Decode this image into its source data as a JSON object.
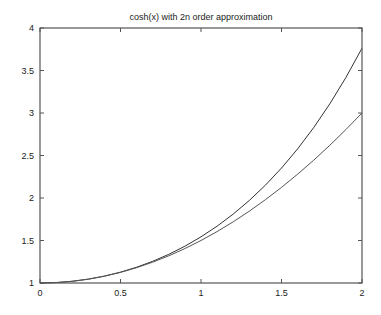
{
  "chart_data": {
    "type": "line",
    "title": "cosh(x) with 2n order approximation",
    "xlabel": "",
    "ylabel": "",
    "xlim": [
      0,
      2
    ],
    "ylim": [
      1,
      4
    ],
    "grid": false,
    "legend": null,
    "x_ticks": [
      0,
      0.5,
      1,
      1.5,
      2
    ],
    "x_tick_labels": [
      "0",
      "0.5",
      "1",
      "1.5",
      "2"
    ],
    "y_ticks": [
      1,
      1.5,
      2,
      2.5,
      3,
      3.5,
      4
    ],
    "y_tick_labels": [
      "1",
      "1.5",
      "2",
      "2.5",
      "3",
      "3.5",
      "4"
    ],
    "x": [
      0,
      0.1,
      0.2,
      0.3,
      0.4,
      0.5,
      0.6,
      0.7,
      0.8,
      0.9,
      1.0,
      1.1,
      1.2,
      1.3,
      1.4,
      1.5,
      1.6,
      1.7,
      1.8,
      1.9,
      2.0
    ],
    "series": [
      {
        "name": "cosh(x)",
        "color": "#333333",
        "values": [
          1.0,
          1.005,
          1.0201,
          1.0453,
          1.0811,
          1.1276,
          1.1855,
          1.2552,
          1.3374,
          1.4331,
          1.5431,
          1.6685,
          1.8107,
          1.9709,
          2.1509,
          2.3524,
          2.5775,
          2.8283,
          3.1075,
          3.4177,
          3.7622
        ]
      },
      {
        "name": "1 + x^2/2",
        "color": "#555555",
        "values": [
          1.0,
          1.005,
          1.02,
          1.045,
          1.08,
          1.125,
          1.18,
          1.245,
          1.32,
          1.405,
          1.5,
          1.605,
          1.72,
          1.845,
          1.98,
          2.125,
          2.28,
          2.445,
          2.62,
          2.805,
          3.0
        ]
      }
    ]
  },
  "plot_area": {
    "left": 40,
    "top": 28,
    "right": 362,
    "bottom": 283
  },
  "colors": {
    "axis": "#555555",
    "background": "#ffffff",
    "text": "#222222"
  }
}
